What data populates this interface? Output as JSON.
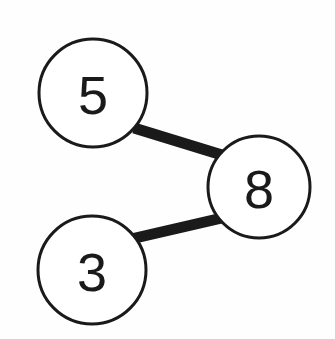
{
  "diagram": {
    "background_color": "#fefefe",
    "stroke_color": "#1a1a1a",
    "node_fill_color": "#ffffff",
    "node_stroke_width": 3,
    "edge_stroke_width": 11,
    "canvas": {
      "width": 335,
      "height": 339
    },
    "nodes": [
      {
        "id": "node-5",
        "label": "5",
        "cx": 93,
        "cy": 93,
        "r": 54
      },
      {
        "id": "node-8",
        "label": "8",
        "cx": 259,
        "cy": 187,
        "r": 51
      },
      {
        "id": "node-3",
        "label": "3",
        "cx": 92,
        "cy": 270,
        "r": 54
      }
    ],
    "edges": [
      {
        "id": "edge-5-8",
        "from": "5",
        "to": "8",
        "x1": 134,
        "y1": 128,
        "x2": 222,
        "y2": 155
      },
      {
        "id": "edge-3-8",
        "from": "3",
        "to": "8",
        "x1": 131,
        "y1": 239,
        "x2": 222,
        "y2": 218
      }
    ]
  }
}
